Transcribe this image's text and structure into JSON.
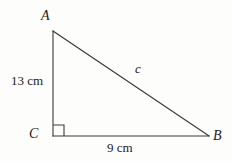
{
  "figure": {
    "type": "right-triangle-diagram",
    "background_color": "#fdfdfc",
    "stroke_color": "#3a3a3a",
    "text_color": "#1c1c1c",
    "vertices": {
      "a": {
        "label": "A",
        "x": 53,
        "y": 31
      },
      "b": {
        "label": "B",
        "x": 209,
        "y": 136
      },
      "c": {
        "label": "C",
        "x": 53,
        "y": 136
      }
    },
    "sides": {
      "vertical_leg": {
        "label": "13 cm",
        "value": 13,
        "unit": "cm",
        "from": "C",
        "to": "A"
      },
      "horizontal_leg": {
        "label": "9 cm",
        "value": 9,
        "unit": "cm",
        "from": "C",
        "to": "B"
      },
      "hypotenuse": {
        "label": "c",
        "from": "A",
        "to": "B"
      }
    },
    "right_angle": {
      "at": "C",
      "marker": "square",
      "size": 11
    }
  }
}
